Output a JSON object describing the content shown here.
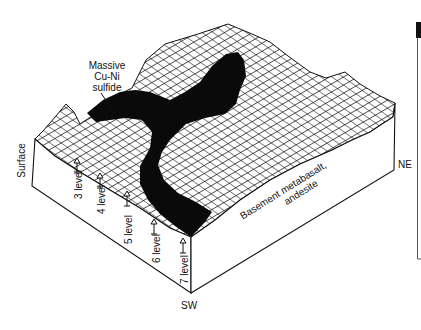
{
  "figure": {
    "type": "3D block diagram (mesh surface)",
    "callout": {
      "lines": [
        "Massive",
        "Cu-Ni",
        "sulfide"
      ]
    },
    "labels": {
      "surface": "Surface",
      "sw": "SW",
      "ne": "NE",
      "basement": [
        "Basement metabasalt,",
        "andesite"
      ]
    },
    "levels": [
      {
        "label": "3 level"
      },
      {
        "label": "4 level"
      },
      {
        "label": "5 level"
      },
      {
        "label": "6 level"
      },
      {
        "label": "7 level"
      }
    ],
    "colors": {
      "line": "#111111",
      "ore_body": "#0a0a0a",
      "background": "#ffffff"
    }
  }
}
